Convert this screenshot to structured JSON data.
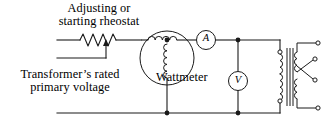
{
  "diagram": {
    "type": "schematic",
    "stroke_color": "#1a1a1a",
    "background_color": "#ffffff"
  },
  "labels": {
    "rheostat": "Adjusting or\nstarting rheostat",
    "rheostat_line1": "Adjusting or",
    "rheostat_line2": "starting rheostat",
    "supply": "Transformer’s rated\nprimary voltage",
    "supply_line1": "Transformer’s rated",
    "supply_line2": "primary voltage",
    "wattmeter": "Wattmeter"
  },
  "meters": {
    "ammeter": {
      "symbol": "A",
      "name": "ammeter",
      "shape": "circle"
    },
    "voltmeter": {
      "symbol": "V",
      "name": "voltmeter",
      "shape": "circle"
    }
  },
  "components": {
    "rheostat": {
      "name": "adjusting-rheostat",
      "symbol": "zigzag-resistor-with-wiper",
      "zigzag_peaks": 4,
      "has_arrow_tap": true
    },
    "wattmeter": {
      "name": "wattmeter",
      "symbol": "circle-with-current-and-voltage-coils",
      "current_coil_loops": 4,
      "voltage_coil_loops": 5
    },
    "transformer": {
      "name": "transformer-under-test",
      "symbol": "two-winding-transformer-with-core",
      "core_lines": 3,
      "primary_coil_sections": 2,
      "secondary_coil_sections": 2,
      "secondary_terminals": 4,
      "secondary_leads_crossed": true
    }
  },
  "nodes": {
    "junction_dots": 4,
    "terminal_circles": 6
  }
}
